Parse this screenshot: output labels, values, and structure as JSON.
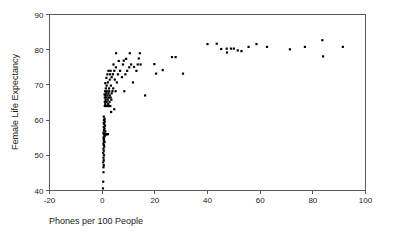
{
  "chart_data": {
    "type": "scatter",
    "title": "",
    "xlabel": "Phones per 100 People",
    "ylabel": "Female Life Expectancy",
    "xlim": [
      -20,
      100
    ],
    "ylim": [
      40,
      90
    ],
    "xticks": [
      -20,
      0,
      20,
      40,
      60,
      80,
      100
    ],
    "xtick_labels": [
      "-20",
      "0",
      "20",
      "40",
      "60",
      "80",
      "100"
    ],
    "yticks": [
      40,
      50,
      60,
      70,
      80,
      90
    ],
    "ytick_labels": [
      "40",
      "50",
      "60",
      "70",
      "80",
      "90"
    ],
    "grid": false,
    "legend": null,
    "marker": "filled-square",
    "marker_color": "#000000",
    "marker_size_px": 2.2,
    "n_points": 122,
    "points": [
      [
        0.3,
        40.6
      ],
      [
        0.4,
        42.5
      ],
      [
        0.5,
        45.2
      ],
      [
        0.5,
        46.6
      ],
      [
        0.6,
        47.2
      ],
      [
        0.4,
        48.0
      ],
      [
        0.6,
        48.6
      ],
      [
        0.5,
        49.3
      ],
      [
        0.7,
        50.0
      ],
      [
        0.4,
        50.6
      ],
      [
        0.6,
        51.3
      ],
      [
        0.5,
        51.9
      ],
      [
        0.8,
        52.5
      ],
      [
        0.6,
        52.9
      ],
      [
        0.5,
        53.4
      ],
      [
        0.9,
        53.8
      ],
      [
        0.6,
        54.2
      ],
      [
        0.7,
        54.6
      ],
      [
        0.5,
        55.0
      ],
      [
        0.8,
        55.3
      ],
      [
        1.0,
        55.6
      ],
      [
        1.4,
        55.9
      ],
      [
        0.6,
        56.0
      ],
      [
        1.8,
        56.0
      ],
      [
        2.2,
        56.0
      ],
      [
        0.9,
        56.2
      ],
      [
        0.5,
        56.5
      ],
      [
        1.2,
        56.8
      ],
      [
        0.7,
        57.2
      ],
      [
        0.9,
        57.6
      ],
      [
        0.6,
        58.0
      ],
      [
        1.1,
        58.4
      ],
      [
        0.8,
        58.8
      ],
      [
        0.6,
        59.2
      ],
      [
        1.0,
        59.6
      ],
      [
        0.7,
        60.0
      ],
      [
        0.9,
        60.4
      ],
      [
        0.6,
        61.0
      ],
      [
        3.4,
        62.3
      ],
      [
        4.6,
        63.1
      ],
      [
        1.0,
        64.0
      ],
      [
        1.5,
        64.0
      ],
      [
        2.0,
        64.0
      ],
      [
        2.6,
        64.0
      ],
      [
        3.1,
        64.0
      ],
      [
        1.2,
        64.6
      ],
      [
        2.3,
        64.6
      ],
      [
        1.0,
        65.2
      ],
      [
        1.7,
        65.2
      ],
      [
        2.8,
        65.2
      ],
      [
        1.3,
        65.8
      ],
      [
        2.1,
        65.8
      ],
      [
        3.5,
        65.8
      ],
      [
        1.0,
        66.4
      ],
      [
        1.6,
        66.4
      ],
      [
        2.5,
        66.4
      ],
      [
        3.2,
        66.4
      ],
      [
        1.2,
        67.0
      ],
      [
        2.0,
        67.0
      ],
      [
        2.9,
        67.0
      ],
      [
        0.9,
        67.3
      ],
      [
        1.5,
        67.6
      ],
      [
        2.4,
        67.6
      ],
      [
        3.6,
        67.6
      ],
      [
        1.1,
        68.2
      ],
      [
        1.9,
        68.2
      ],
      [
        2.7,
        68.2
      ],
      [
        3.9,
        68.2
      ],
      [
        5.1,
        68.2
      ],
      [
        8.4,
        68.2
      ],
      [
        16.3,
        67.0
      ],
      [
        1.4,
        69.0
      ],
      [
        2.6,
        69.0
      ],
      [
        4.2,
        69.0
      ],
      [
        1.7,
        69.8
      ],
      [
        3.3,
        69.8
      ],
      [
        1.2,
        70.5
      ],
      [
        2.2,
        70.7
      ],
      [
        5.6,
        70.7
      ],
      [
        11.7,
        70.7
      ],
      [
        2.9,
        71.5
      ],
      [
        4.8,
        71.5
      ],
      [
        1.6,
        72.0
      ],
      [
        3.6,
        72.2
      ],
      [
        7.5,
        72.2
      ],
      [
        2.0,
        73.0
      ],
      [
        3.0,
        73.0
      ],
      [
        4.1,
        73.0
      ],
      [
        6.0,
        73.0
      ],
      [
        8.8,
        73.0
      ],
      [
        20.5,
        73.2
      ],
      [
        30.7,
        73.2
      ],
      [
        2.4,
        74.0
      ],
      [
        3.2,
        74.0
      ],
      [
        4.6,
        74.0
      ],
      [
        6.8,
        74.0
      ],
      [
        9.5,
        74.0
      ],
      [
        13.0,
        74.0
      ],
      [
        23.0,
        74.2
      ],
      [
        5.2,
        75.0
      ],
      [
        10.3,
        75.0
      ],
      [
        12.1,
        75.1
      ],
      [
        4.3,
        75.8
      ],
      [
        7.9,
        75.8
      ],
      [
        11.0,
        75.8
      ],
      [
        13.5,
        75.8
      ],
      [
        14.6,
        75.8
      ],
      [
        19.8,
        75.9
      ],
      [
        6.3,
        76.8
      ],
      [
        8.2,
        76.9
      ],
      [
        9.1,
        77.4
      ],
      [
        13.9,
        77.5
      ],
      [
        26.5,
        77.9
      ],
      [
        27.9,
        77.9
      ],
      [
        5.3,
        79.0
      ],
      [
        10.5,
        79.0
      ],
      [
        14.3,
        79.0
      ],
      [
        40.0,
        81.6
      ],
      [
        43.5,
        81.7
      ],
      [
        45.2,
        80.2
      ],
      [
        47.3,
        80.3
      ],
      [
        47.4,
        79.2
      ],
      [
        48.9,
        80.3
      ],
      [
        50.0,
        80.3
      ],
      [
        51.5,
        79.8
      ],
      [
        52.9,
        79.6
      ],
      [
        55.6,
        80.8
      ],
      [
        58.6,
        81.6
      ],
      [
        62.6,
        80.8
      ],
      [
        71.3,
        80.1
      ],
      [
        77.0,
        80.8
      ],
      [
        83.6,
        82.7
      ],
      [
        83.9,
        78.1
      ],
      [
        91.4,
        80.8
      ]
    ]
  },
  "axes": {
    "x_axis_label": "Phones per 100 People",
    "y_axis_label": "Female Life Expectancy"
  },
  "colors": {
    "marker": "#000000",
    "frame": "#5a5a5a",
    "text": "#1a1a1a",
    "background": "#ffffff"
  }
}
